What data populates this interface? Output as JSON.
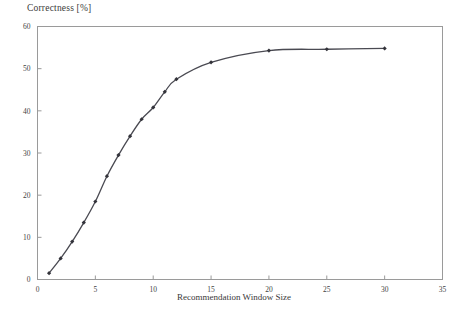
{
  "chart_data": {
    "type": "line",
    "title": "Correctness [%]",
    "xlabel": "Recommendation Window Size",
    "ylabel": "Correctness [%]",
    "xlim": [
      0,
      35
    ],
    "ylim": [
      0,
      60
    ],
    "grid": false,
    "legend": null,
    "marker": "filled-diamond",
    "line_color": "#4a4a52",
    "marker_color": "#33333a",
    "xticks": [
      0,
      5,
      10,
      15,
      20,
      25,
      30,
      35
    ],
    "yticks": [
      0,
      10,
      20,
      30,
      40,
      50,
      60
    ],
    "x": [
      1,
      2,
      3,
      4,
      5,
      6,
      7,
      8,
      9,
      10,
      11,
      12,
      15,
      20,
      25,
      30
    ],
    "values": [
      1.5,
      5.0,
      9.0,
      13.5,
      18.5,
      24.5,
      29.5,
      34.0,
      38.0,
      40.8,
      44.5,
      47.5,
      51.5,
      54.3,
      54.6,
      54.8
    ],
    "series": [
      {
        "name": "Correctness",
        "values": [
          1.5,
          5.0,
          9.0,
          13.5,
          18.5,
          24.5,
          29.5,
          34.0,
          38.0,
          40.8,
          44.5,
          47.5,
          51.5,
          54.3,
          54.6,
          54.8
        ]
      }
    ]
  }
}
